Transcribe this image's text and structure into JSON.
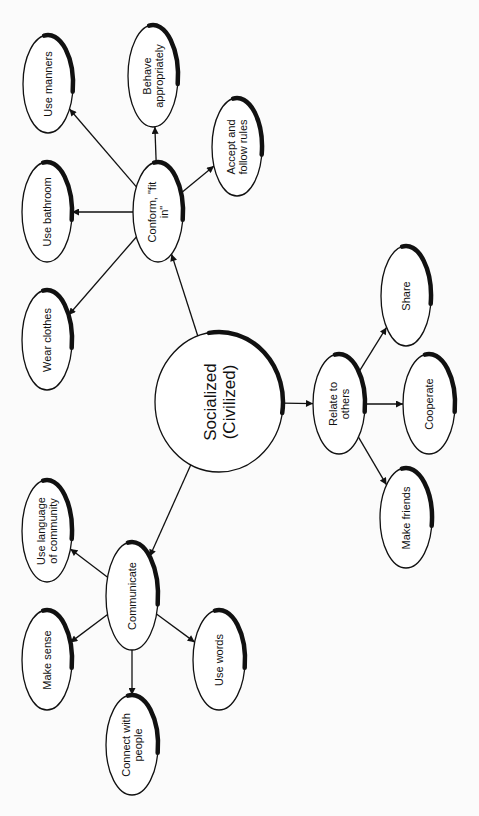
{
  "diagram": {
    "type": "concept-map",
    "orientation": "rotated-90-ccw",
    "center": {
      "id": "socialized",
      "lines": [
        "Socialized",
        "(Civilized)"
      ]
    },
    "nodes": [
      {
        "id": "conform",
        "lines": [
          "Conform, \"fit",
          "in\""
        ]
      },
      {
        "id": "use-manners",
        "lines": [
          "Use manners"
        ]
      },
      {
        "id": "behave",
        "lines": [
          "Behave",
          "appropriately"
        ]
      },
      {
        "id": "accept-rules",
        "lines": [
          "Accept and",
          "follow rules"
        ]
      },
      {
        "id": "use-bathroom",
        "lines": [
          "Use bathroom"
        ]
      },
      {
        "id": "wear-clothes",
        "lines": [
          "Wear clothes"
        ]
      },
      {
        "id": "relate",
        "lines": [
          "Relate to",
          "others"
        ]
      },
      {
        "id": "share",
        "lines": [
          "Share"
        ]
      },
      {
        "id": "cooperate",
        "lines": [
          "Cooperate"
        ]
      },
      {
        "id": "make-friends",
        "lines": [
          "Make friends"
        ]
      },
      {
        "id": "communicate",
        "lines": [
          "Communicate"
        ]
      },
      {
        "id": "use-language",
        "lines": [
          "Use language",
          "of community"
        ]
      },
      {
        "id": "make-sense",
        "lines": [
          "Make sense"
        ]
      },
      {
        "id": "use-words",
        "lines": [
          "Use words"
        ]
      },
      {
        "id": "connect",
        "lines": [
          "Connect with",
          "people"
        ]
      }
    ],
    "edges": [
      {
        "from": "socialized",
        "to": "conform"
      },
      {
        "from": "socialized",
        "to": "relate"
      },
      {
        "from": "socialized",
        "to": "communicate"
      },
      {
        "from": "conform",
        "to": "use-manners"
      },
      {
        "from": "conform",
        "to": "behave"
      },
      {
        "from": "conform",
        "to": "accept-rules"
      },
      {
        "from": "conform",
        "to": "use-bathroom"
      },
      {
        "from": "conform",
        "to": "wear-clothes"
      },
      {
        "from": "relate",
        "to": "share"
      },
      {
        "from": "relate",
        "to": "cooperate"
      },
      {
        "from": "relate",
        "to": "make-friends"
      },
      {
        "from": "communicate",
        "to": "use-language"
      },
      {
        "from": "communicate",
        "to": "make-sense"
      },
      {
        "from": "communicate",
        "to": "use-words"
      },
      {
        "from": "communicate",
        "to": "connect"
      }
    ]
  }
}
